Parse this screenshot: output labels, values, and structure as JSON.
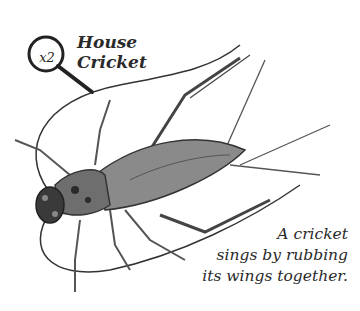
{
  "figure": {
    "title_line1": "House",
    "title_line2": "Cricket",
    "magnification": "x2",
    "caption": [
      "A cricket",
      "sings by rubbing",
      "its wings together."
    ],
    "colors": {
      "ink": "#2a2a2a",
      "body_dark": "#3a3a3a",
      "body_mid": "#6e6e6e",
      "wing": "#8a8a8a",
      "background": "#ffffff"
    }
  }
}
